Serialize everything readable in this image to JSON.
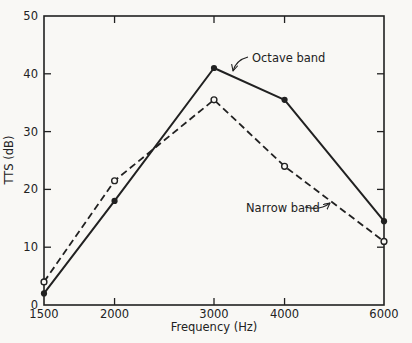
{
  "figure": {
    "background": "#f9f8f5",
    "ink_color": "#212121"
  },
  "chart_data": {
    "type": "line",
    "title": "",
    "xlabel": "Frequency (Hz)",
    "ylabel": "TTS (dB)",
    "x_scale": "log",
    "xlim": [
      1500,
      6000
    ],
    "ylim": [
      0,
      50
    ],
    "grid": false,
    "legend_position": "none (inline text annotations with leader arrows)",
    "x": [
      1500,
      2000,
      3000,
      4000,
      6000
    ],
    "x_ticks": [
      {
        "value": 1500,
        "label": "1500"
      },
      {
        "value": 2000,
        "label": "2000"
      },
      {
        "value": 3000,
        "label": "3000"
      },
      {
        "value": 4000,
        "label": "4000"
      },
      {
        "value": 6000,
        "label": "6000"
      }
    ],
    "y_ticks": [
      {
        "value": 0,
        "label": "0"
      },
      {
        "value": 10,
        "label": "10"
      },
      {
        "value": 20,
        "label": "20"
      },
      {
        "value": 30,
        "label": "30"
      },
      {
        "value": 40,
        "label": "40"
      },
      {
        "value": 50,
        "label": "50"
      }
    ],
    "series": [
      {
        "name": "Octave band",
        "values": [
          2,
          18,
          41,
          35.5,
          14.5
        ],
        "line_style": "solid",
        "marker": "filled-circle"
      },
      {
        "name": "Narrow band",
        "values": [
          4,
          21.5,
          35.5,
          24,
          11
        ],
        "line_style": "dashed",
        "marker": "open-circle"
      }
    ],
    "annotations": [
      {
        "text": "Octave band",
        "text_x": 252,
        "text_y": 62,
        "anchor": "start",
        "arrow_path": "M248,57 Q236,60 233,71",
        "points_at": "solid line between 3000 and 4000 Hz"
      },
      {
        "text": "Narrow band",
        "text_x": 246,
        "text_y": 212,
        "anchor": "start",
        "arrow_path": "M305,207 Q320,211 330,203",
        "points_at": "dashed line between 4000 and 6000 Hz"
      }
    ]
  }
}
